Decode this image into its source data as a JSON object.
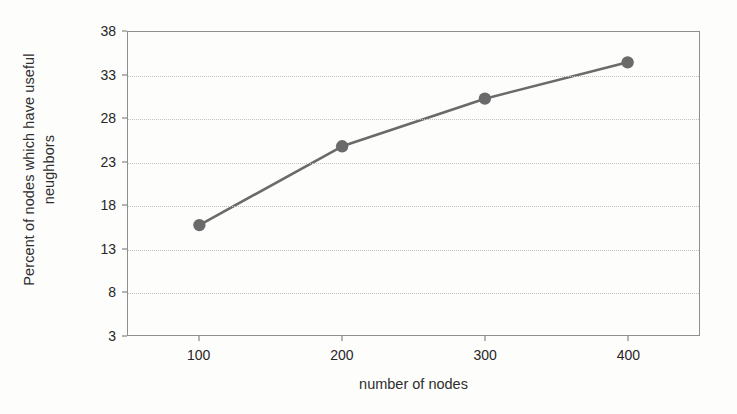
{
  "chart_data": {
    "type": "line",
    "title": "",
    "xlabel": "number of nodes",
    "ylabel_line1": "Percent of nodes which have useful",
    "ylabel_line2": "neughbors",
    "ylabel": "Percent of nodes which have useful neughbors",
    "x": [
      100,
      200,
      300,
      400
    ],
    "values": [
      15.7,
      24.8,
      30.3,
      34.5
    ],
    "categories": [
      "100",
      "200",
      "300",
      "400"
    ],
    "xtick_labels": [
      "100",
      "200",
      "300",
      "400"
    ],
    "ytick_labels": [
      "38",
      "33",
      "28",
      "23",
      "18",
      "13",
      "8",
      "3"
    ],
    "ytick_values": [
      38,
      33,
      28,
      23,
      18,
      13,
      8,
      3
    ],
    "ylim": [
      3,
      38
    ],
    "xlim": [
      50,
      450
    ],
    "grid": "horizontal-dotted",
    "legend": "none",
    "series": [
      {
        "name": "percent of nodes with useful neughbors",
        "values": [
          15.7,
          24.8,
          30.3,
          34.5
        ]
      }
    ],
    "style": {
      "line_color": "#6a6a6a",
      "marker_color": "#6a6a6a",
      "marker_shape": "circle",
      "gridline_color": "#c2c2c2",
      "frame_color": "#8f8f8f",
      "background": "#fdfdfc",
      "text_color": "#262626"
    }
  }
}
